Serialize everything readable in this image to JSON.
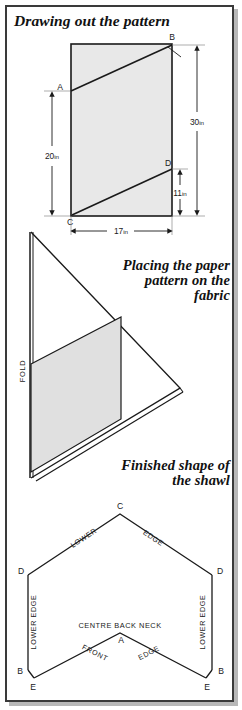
{
  "page": {
    "kind": "sewing-pattern-instruction-page",
    "colors": {
      "fabric_fill": "#e8e8e8",
      "line": "#1a1a1a",
      "frame": "#3a3a3a",
      "background": "#ffffff"
    }
  },
  "sections": [
    {
      "id": "drawing-out-the-pattern",
      "title": "Drawing out the pattern"
    },
    {
      "id": "placing-the-paper-pattern",
      "title": "Placing the paper\npattern on the\nfabric",
      "title_lines": [
        "Placing the paper",
        "pattern on the",
        "fabric"
      ]
    },
    {
      "id": "finished-shape",
      "title": "Finished shape of\nthe shawl",
      "title_lines": [
        "Finished shape of",
        "the shawl"
      ]
    }
  ],
  "diagram_pattern": {
    "points": [
      "A",
      "B",
      "C",
      "D"
    ],
    "point_a": "A",
    "point_b": "B",
    "point_c": "C",
    "point_d": "D",
    "dimensions": [
      {
        "value": "20",
        "unit": "in",
        "label": "20in",
        "orientation": "vertical",
        "side": "left"
      },
      {
        "value": "30",
        "unit": "in",
        "label": "30in",
        "orientation": "vertical",
        "side": "right"
      },
      {
        "value": "11",
        "unit": "in",
        "label": "11in",
        "orientation": "vertical",
        "side": "right-inner"
      },
      {
        "value": "17",
        "unit": "in",
        "label": "17in",
        "orientation": "horizontal",
        "side": "bottom"
      }
    ]
  },
  "diagram_fabric": {
    "fold_label": "FOLD"
  },
  "diagram_shawl": {
    "points": {
      "top": "C",
      "left_upper": "D",
      "right_upper": "D",
      "left_lower": "B",
      "left_bottom": "E",
      "right_lower": "B",
      "right_bottom": "E",
      "neck": "A"
    },
    "labels": {
      "lower": "LOWER",
      "edge": "EDGE",
      "lower_edge": "LOWER EDGE",
      "centre_back_neck": "CENTRE BACK NECK",
      "front": "FRONT",
      "front_edge": "EDGE"
    }
  }
}
